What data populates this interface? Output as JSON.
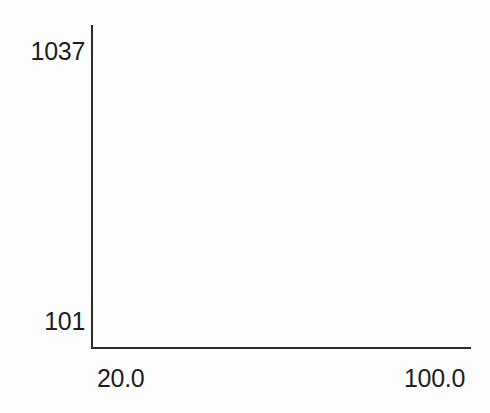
{
  "chart_data": {
    "type": "line",
    "title": "",
    "subtitle": "",
    "xlabel": "",
    "ylabel": "",
    "xlim": [
      20.0,
      100.0
    ],
    "ylim": [
      101,
      1037
    ],
    "x_tick_labels": [
      "20.0",
      "100.0"
    ],
    "y_tick_labels": [
      "1037",
      "101"
    ],
    "x": [],
    "values": [],
    "series": [],
    "annotations": [],
    "legend": null,
    "legend_position": "none",
    "grid": false,
    "ticks_visible": false,
    "empty_plot": true,
    "note": "Axes drawn with no plotted data; plotting region is blank."
  },
  "axes": {
    "y_axis": {
      "max_label": "1037",
      "min_label": "101"
    },
    "x_axis": {
      "min_label": "20.0",
      "max_label": "100.0"
    }
  },
  "style": {
    "background_color": "#fdfdfd",
    "axis_color": "#2b2b2b",
    "text_color": "#1f1f1f"
  }
}
